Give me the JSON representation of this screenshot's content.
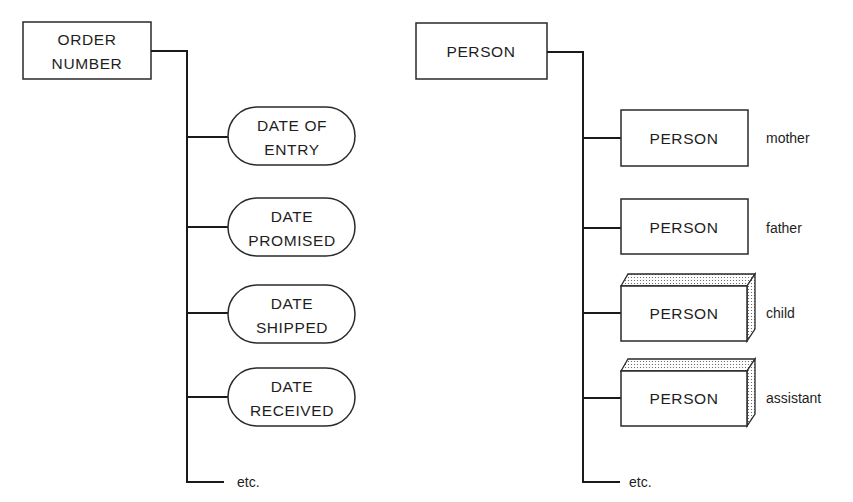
{
  "left_diagram": {
    "root": {
      "line1": "ORDER",
      "line2": "NUMBER",
      "shape": "rectangle"
    },
    "children": [
      {
        "line1": "DATE OF",
        "line2": "ENTRY",
        "shape": "rounded-pill"
      },
      {
        "line1": "DATE",
        "line2": "PROMISED",
        "shape": "rounded-pill"
      },
      {
        "line1": "DATE",
        "line2": "SHIPPED",
        "shape": "rounded-pill"
      },
      {
        "line1": "DATE",
        "line2": "RECEIVED",
        "shape": "rounded-pill"
      }
    ],
    "etc_label": "etc."
  },
  "right_diagram": {
    "root": {
      "label": "PERSON",
      "shape": "rectangle"
    },
    "children": [
      {
        "label": "PERSON",
        "role": "mother",
        "shape": "rectangle"
      },
      {
        "label": "PERSON",
        "role": "father",
        "shape": "rectangle"
      },
      {
        "label": "PERSON",
        "role": "child",
        "shape": "3d-box"
      },
      {
        "label": "PERSON",
        "role": "assistant",
        "shape": "3d-box"
      }
    ],
    "etc_label": "etc."
  }
}
